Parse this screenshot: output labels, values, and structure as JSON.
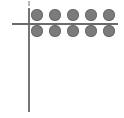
{
  "diagram": {
    "background_color": "#ffffff",
    "axes": {
      "vertical": {
        "label": "vertical-axis",
        "color": "#757575",
        "x": 28,
        "y_start": 8,
        "y_end": 112,
        "thickness": 2
      },
      "horizontal": {
        "label": "horizontal-axis",
        "color": "#6b6b6b",
        "y": 23,
        "x_start": 12,
        "x_end": 118,
        "thickness": 2
      },
      "tick": {
        "label": "top-tick-mark",
        "color": "#b9b9b9",
        "x": 28,
        "y": 1,
        "width": 2,
        "height": 5
      }
    },
    "dots": {
      "color": "#7b7b7b",
      "edge_color": "#6d6d6d",
      "diameter": 12,
      "rows": [
        {
          "name": "upper-row",
          "position": "above-horizontal-axis",
          "count": 5,
          "y": 15
        },
        {
          "name": "lower-row",
          "position": "below-horizontal-axis",
          "count": 5,
          "y": 31
        }
      ],
      "total_count": 10,
      "x_positions": [
        37,
        55,
        73,
        91,
        109
      ]
    }
  }
}
